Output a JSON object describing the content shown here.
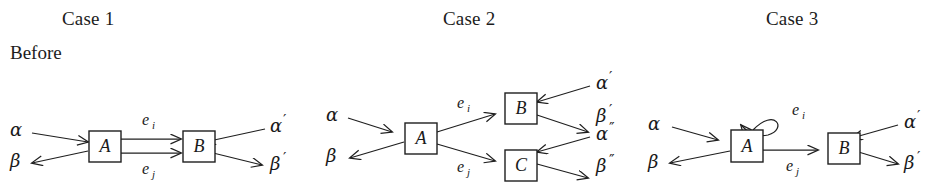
{
  "figure": {
    "background_color": "#ffffff",
    "ink_color": "#1f1f1f",
    "row_label": "Before",
    "cases": [
      {
        "id": "case-1",
        "title": "Case 1",
        "nodes": [
          "A",
          "B"
        ],
        "edge_labels": [
          "e_i",
          "e_j"
        ],
        "edges": [
          {
            "label": "e",
            "sub": "i",
            "from": "A",
            "to": "B"
          },
          {
            "label": "e",
            "sub": "j",
            "from": "A",
            "to": "B"
          }
        ],
        "external_labels": [
          {
            "name": "alpha-in",
            "base": "α",
            "prime": "",
            "side": "left",
            "direction": "in"
          },
          {
            "name": "beta-out",
            "base": "β",
            "prime": "",
            "side": "left",
            "direction": "out"
          },
          {
            "name": "alpha-prime-in",
            "base": "α",
            "prime": "′",
            "side": "right",
            "direction": "in"
          },
          {
            "name": "beta-prime-out",
            "base": "β",
            "prime": "′",
            "side": "right",
            "direction": "out"
          }
        ]
      },
      {
        "id": "case-2",
        "title": "Case 2",
        "nodes": [
          "A",
          "B",
          "C"
        ],
        "edge_labels": [
          "e_i",
          "e_j"
        ],
        "edges": [
          {
            "label": "e",
            "sub": "i",
            "from": "A",
            "to": "B"
          },
          {
            "label": "e",
            "sub": "j",
            "from": "A",
            "to": "C"
          }
        ],
        "external_labels": [
          {
            "name": "alpha-in",
            "base": "α",
            "prime": "",
            "side": "left",
            "direction": "in"
          },
          {
            "name": "beta-out",
            "base": "β",
            "prime": "",
            "side": "left",
            "direction": "out"
          },
          {
            "name": "alpha-prime-in",
            "base": "α",
            "prime": "′",
            "side": "right",
            "direction": "in"
          },
          {
            "name": "beta-prime-out",
            "base": "β",
            "prime": "′",
            "side": "right",
            "direction": "out"
          },
          {
            "name": "alpha-dprime-in",
            "base": "α",
            "prime": "″",
            "side": "right",
            "direction": "in"
          },
          {
            "name": "beta-dprime-out",
            "base": "β",
            "prime": "″",
            "side": "right",
            "direction": "out"
          }
        ]
      },
      {
        "id": "case-3",
        "title": "Case 3",
        "nodes": [
          "A",
          "B"
        ],
        "edge_labels": [
          "e_i",
          "e_j"
        ],
        "edges": [
          {
            "label": "e",
            "sub": "i",
            "from": "A",
            "to": "A",
            "self_loop": true
          },
          {
            "label": "e",
            "sub": "j",
            "from": "A",
            "to": "B"
          }
        ],
        "external_labels": [
          {
            "name": "alpha-in",
            "base": "α",
            "prime": "",
            "side": "left",
            "direction": "in"
          },
          {
            "name": "beta-out",
            "base": "β",
            "prime": "",
            "side": "left",
            "direction": "out"
          },
          {
            "name": "alpha-prime-in",
            "base": "α",
            "prime": "′",
            "side": "right",
            "direction": "in"
          },
          {
            "name": "beta-prime-out",
            "base": "β",
            "prime": "′",
            "side": "right",
            "direction": "out"
          }
        ]
      }
    ]
  }
}
